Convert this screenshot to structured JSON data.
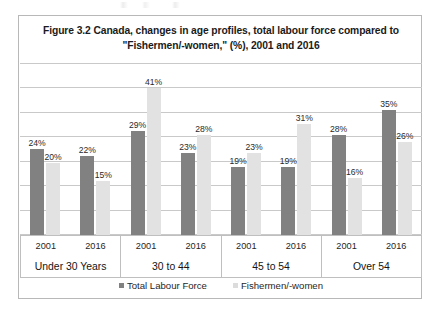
{
  "figure": {
    "title_line_1": "Figure 3.2 Canada, changes in age profiles, total labour force compared to",
    "title_line_2": "\"Fishermen/-women,\" (%), 2001 and 2016"
  },
  "legend": {
    "position": "bottom-center",
    "items": [
      {
        "label": "Total Labour Force",
        "color": "#818181",
        "marker": "square-swatch"
      },
      {
        "label": "Fishermen/-women",
        "color": "#dcdcdc",
        "marker": "square-swatch"
      }
    ]
  },
  "axis": {
    "groups": [
      {
        "age_label": "Under 30 Years",
        "years": [
          "2001",
          "2016"
        ]
      },
      {
        "age_label": "30 to 44",
        "years": [
          "2001",
          "2016"
        ]
      },
      {
        "age_label": "45 to 54",
        "years": [
          "2001",
          "2016"
        ]
      },
      {
        "age_label": "Over 54",
        "years": [
          "2001",
          "2016"
        ]
      }
    ]
  },
  "chart_data": {
    "type": "bar",
    "title": "Figure 3.2 Canada, changes in age profiles, total labour force compared to \"Fishermen/-women,\" (%), 2001 and 2016",
    "xlabel": "",
    "ylabel": "",
    "ylim": [
      0,
      48
    ],
    "grid": true,
    "gridline_count": 8,
    "value_suffix": "%",
    "categories": [
      "Under 30 Years – 2001",
      "Under 30 Years – 2016",
      "30 to 44 – 2001",
      "30 to 44 – 2016",
      "45 to 54 – 2001",
      "45 to 54 – 2016",
      "Over 54 – 2001",
      "Over 54 – 2016"
    ],
    "series": [
      {
        "name": "Total Labour Force",
        "color": "#818181",
        "values": [
          24,
          22,
          29,
          23,
          19,
          19,
          28,
          35
        ],
        "labels": [
          "24%",
          "22%",
          "29%",
          "23%",
          "19%",
          "19%",
          "28%",
          "35%"
        ]
      },
      {
        "name": "Fishermen/-women",
        "color": "#e2e2e2",
        "values": [
          20,
          15,
          41,
          28,
          23,
          31,
          16,
          26
        ],
        "labels": [
          "20%",
          "15%",
          "41%",
          "28%",
          "23%",
          "31%",
          "16%",
          "26%"
        ]
      }
    ],
    "groups": [
      {
        "age_label": "Under 30 Years",
        "pairs": [
          {
            "year": "2001",
            "total_labour_force": 24,
            "fishermen": 20,
            "total_label": "24%",
            "fishermen_label": "20%"
          },
          {
            "year": "2016",
            "total_labour_force": 22,
            "fishermen": 15,
            "total_label": "22%",
            "fishermen_label": "15%"
          }
        ]
      },
      {
        "age_label": "30 to 44",
        "pairs": [
          {
            "year": "2001",
            "total_labour_force": 29,
            "fishermen": 41,
            "total_label": "29%",
            "fishermen_label": "41%"
          },
          {
            "year": "2016",
            "total_labour_force": 23,
            "fishermen": 28,
            "total_label": "23%",
            "fishermen_label": "28%"
          }
        ]
      },
      {
        "age_label": "45 to 54",
        "pairs": [
          {
            "year": "2001",
            "total_labour_force": 19,
            "fishermen": 23,
            "total_label": "19%",
            "fishermen_label": "23%"
          },
          {
            "year": "2016",
            "total_labour_force": 19,
            "fishermen": 31,
            "total_label": "19%",
            "fishermen_label": "31%"
          }
        ]
      },
      {
        "age_label": "Over 54",
        "pairs": [
          {
            "year": "2001",
            "total_labour_force": 28,
            "fishermen": 16,
            "total_label": "28%",
            "fishermen_label": "16%"
          },
          {
            "year": "2016",
            "total_labour_force": 35,
            "fishermen": 26,
            "total_label": "35%",
            "fishermen_label": "26%"
          }
        ]
      }
    ]
  }
}
